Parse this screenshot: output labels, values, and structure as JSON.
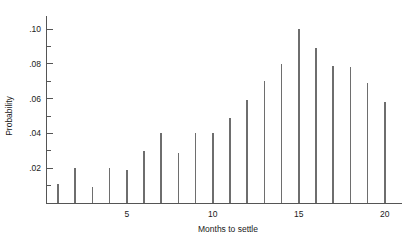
{
  "chart_data": {
    "type": "bar",
    "title": "",
    "subtitle": "",
    "xlabel": "Months to settle",
    "ylabel": "Probability",
    "categories": [
      1,
      2,
      3,
      4,
      5,
      6,
      7,
      8,
      9,
      10,
      11,
      12,
      13,
      14,
      15,
      16,
      17,
      18,
      19,
      20
    ],
    "values": [
      0.011,
      0.02,
      0.009,
      0.02,
      0.019,
      0.03,
      0.04,
      0.029,
      0.04,
      0.04,
      0.049,
      0.059,
      0.07,
      0.08,
      0.1,
      0.089,
      0.079,
      0.078,
      0.069,
      0.058
    ],
    "xlim": [
      0.3,
      21.0
    ],
    "ylim": [
      0.0,
      0.108
    ],
    "x_ticks": [
      1,
      2,
      3,
      4,
      5,
      6,
      7,
      8,
      9,
      10,
      11,
      12,
      13,
      14,
      15,
      16,
      17,
      18,
      19,
      20
    ],
    "x_tick_labels": [
      "",
      "",
      "",
      "",
      "5",
      "",
      "",
      "",
      "",
      "10",
      "",
      "",
      "",
      "",
      "15",
      "",
      "",
      "",
      "",
      "20"
    ],
    "y_ticks": [
      0.01,
      0.02,
      0.03,
      0.04,
      0.05,
      0.06,
      0.07,
      0.08,
      0.09,
      0.1
    ],
    "y_tick_labels": [
      "",
      ".02",
      "",
      ".04",
      "",
      ".06",
      "",
      ".08",
      "",
      ".10"
    ],
    "grid": false,
    "legend": null,
    "legend_position": "none",
    "series_color": "#6e6e6e",
    "axis_color": "#555555"
  },
  "labels": {
    "y_axis_title": "Probability",
    "x_axis_title": "Months to settle",
    "y_02": ".02",
    "y_04": ".04",
    "y_06": ".06",
    "y_08": ".08",
    "y_10": ".10",
    "x_5": "5",
    "x_10": "10",
    "x_15": "15",
    "x_20": "20"
  }
}
